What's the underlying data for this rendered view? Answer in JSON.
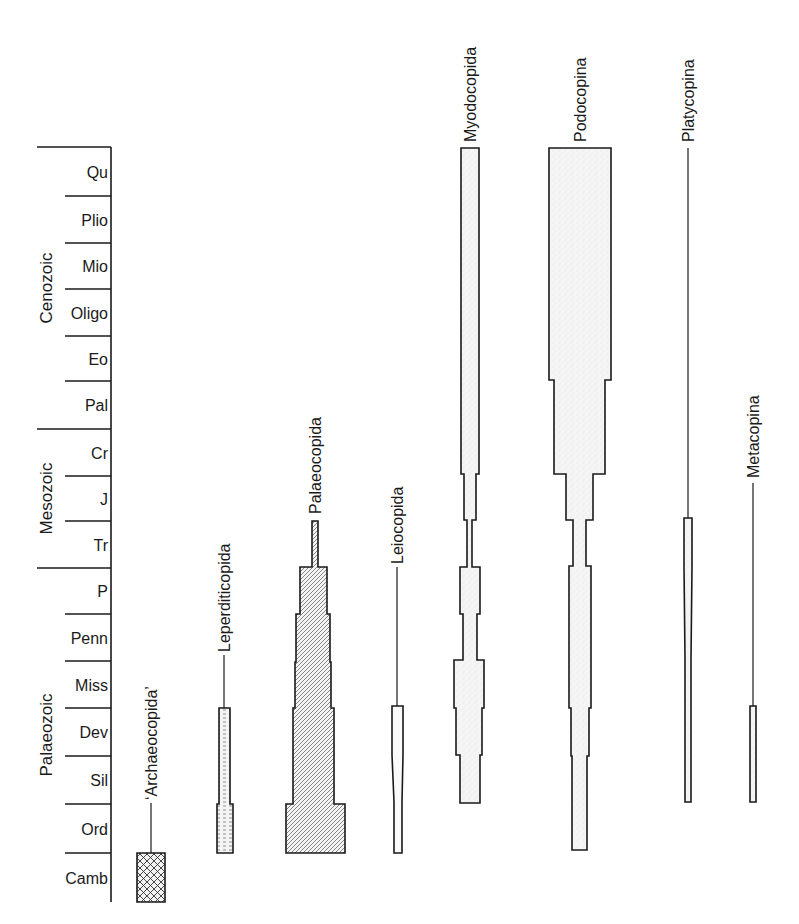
{
  "chart_data": {
    "type": "range-chart",
    "title": "",
    "eras": [
      {
        "name": "Cenozoic",
        "top": 147,
        "bottom": 429
      },
      {
        "name": "Mesozoic",
        "top": 429,
        "bottom": 568
      },
      {
        "name": "Palaeozoic",
        "top": 568,
        "bottom": 902
      }
    ],
    "periods": [
      {
        "label": "Qu",
        "top": 147,
        "bottom": 196
      },
      {
        "label": "Plio",
        "top": 196,
        "bottom": 243
      },
      {
        "label": "Mio",
        "top": 243,
        "bottom": 289
      },
      {
        "label": "Oligo",
        "top": 289,
        "bottom": 336
      },
      {
        "label": "Eo",
        "top": 336,
        "bottom": 381
      },
      {
        "label": "Pal",
        "top": 381,
        "bottom": 429
      },
      {
        "label": "Cr",
        "top": 429,
        "bottom": 476
      },
      {
        "label": "J",
        "top": 476,
        "bottom": 521
      },
      {
        "label": "Tr",
        "top": 521,
        "bottom": 568
      },
      {
        "label": "P",
        "top": 568,
        "bottom": 614
      },
      {
        "label": "Penn",
        "top": 614,
        "bottom": 661
      },
      {
        "label": "Miss",
        "top": 661,
        "bottom": 708
      },
      {
        "label": "Dev",
        "top": 708,
        "bottom": 756
      },
      {
        "label": "Sil",
        "top": 756,
        "bottom": 804
      },
      {
        "label": "Ord",
        "top": 804,
        "bottom": 853
      },
      {
        "label": "Camb",
        "top": 853,
        "bottom": 902
      }
    ],
    "taxa": [
      {
        "name": "‘Archaeocopida’",
        "pattern": "crosshatch",
        "center": 151,
        "label_top": 655,
        "label_bottom": 800,
        "line": [
          [
            151,
            803,
            853
          ]
        ],
        "blocks": [
          [
            137,
            165,
            853,
            902
          ]
        ]
      },
      {
        "name": "Leperditicopida",
        "pattern": "dashes",
        "center": 224,
        "label_top": 512,
        "label_bottom": 652,
        "line": [
          [
            224,
            655,
            708
          ]
        ],
        "blocks": [
          [
            219,
            230,
            708,
            804
          ],
          [
            217,
            233,
            804,
            853
          ]
        ]
      },
      {
        "name": "Palaeocopida",
        "pattern": "diagonal",
        "center": 315,
        "label_top": 470,
        "label_bottom": 514,
        "line": [],
        "blocks": [
          [
            312,
            318,
            521,
            567
          ],
          [
            300,
            327,
            567,
            614
          ],
          [
            296,
            330,
            614,
            662
          ],
          [
            295,
            331,
            662,
            708
          ],
          [
            293,
            334,
            708,
            804
          ],
          [
            286,
            345,
            804,
            853
          ]
        ]
      },
      {
        "name": "Leiocopida",
        "pattern": "none",
        "center": 397,
        "label_top": 470,
        "label_bottom": 564,
        "line": [
          [
            397,
            567,
            706
          ]
        ],
        "thick_line": [
          [
            397,
            755,
            802
          ]
        ],
        "blocks": [
          [
            392,
            403,
            706,
            755
          ],
          [
            394,
            402,
            802,
            853
          ]
        ]
      },
      {
        "name": "Myodocopida",
        "pattern": "stipple",
        "center": 470,
        "label_top": 14,
        "label_bottom": 142,
        "line": [],
        "blocks": [
          [
            461,
            479,
            148,
            474
          ],
          [
            464,
            476,
            474,
            520
          ],
          [
            467,
            472,
            520,
            567
          ],
          [
            460,
            480,
            567,
            614
          ],
          [
            463,
            477,
            614,
            660
          ],
          [
            454,
            484,
            660,
            708
          ],
          [
            456,
            482,
            708,
            755
          ],
          [
            460,
            480,
            755,
            803
          ]
        ]
      },
      {
        "name": "Podocopina",
        "pattern": "stipple",
        "center": 580,
        "label_top": 14,
        "label_bottom": 142,
        "line": [],
        "blocks": [
          [
            549,
            611,
            148,
            380
          ],
          [
            554,
            605,
            380,
            474
          ],
          [
            566,
            593,
            474,
            520
          ],
          [
            573,
            586,
            520,
            566
          ],
          [
            569,
            591,
            566,
            708
          ],
          [
            571,
            589,
            708,
            756
          ],
          [
            572,
            587,
            756,
            850
          ]
        ]
      },
      {
        "name": "Platycopina",
        "pattern": "stipple",
        "center": 688,
        "label_top": 14,
        "label_bottom": 142,
        "line": [
          [
            688,
            148,
            518
          ],
          [
            688,
            567,
            659
          ]
        ],
        "blocks": [
          [
            684,
            692,
            518,
            567
          ],
          [
            685,
            691,
            659,
            802
          ]
        ]
      },
      {
        "name": "Metacopina",
        "pattern": "stipple",
        "center": 753,
        "label_top": 358,
        "label_bottom": 478,
        "line": [
          [
            753,
            483,
            706
          ]
        ],
        "blocks": [
          [
            750,
            756,
            706,
            802
          ]
        ]
      }
    ],
    "colors": {
      "ink": "#1a1a1a",
      "fill": "#f4f4f4",
      "background": "#ffffff"
    }
  }
}
